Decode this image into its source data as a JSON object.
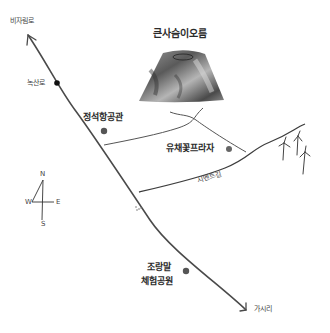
{
  "map": {
    "title": "큰사슴이오름 주변 약도",
    "colors": {
      "background": "#ffffff",
      "road": "#4a4a4a",
      "poi_dot": "#555555",
      "black_dot": "#111111",
      "volcano_dark": "#3c3c3c",
      "volcano_mid": "#8a8a8a",
      "volcano_light": "#c9c9c9"
    },
    "directions": {
      "north_end": "비자림로",
      "south_end": "가시리"
    },
    "landmarks": {
      "oreum": "큰사슴이오름",
      "nogsanro": "녹산로",
      "aviation_museum": "정석항공관",
      "canola_plaza": "유채꽃프라자",
      "cement_road": "시멘트길",
      "pony_park_line1": "조랑말",
      "pony_park_line2": "체험공원"
    },
    "compass": {
      "n": "N",
      "s": "S",
      "e": "E",
      "w": "W"
    },
    "wind_turbines": {
      "count": 3
    }
  }
}
